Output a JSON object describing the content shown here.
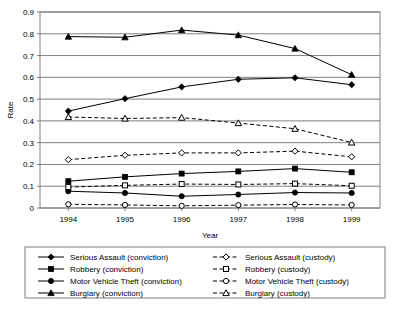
{
  "chart_data": {
    "type": "line",
    "title": "",
    "xlabel": "Year",
    "ylabel": "Rate",
    "categories": [
      "1994",
      "1995",
      "1996",
      "1997",
      "1998",
      "1999"
    ],
    "x": [
      1994,
      1995,
      1996,
      1997,
      1998,
      1999
    ],
    "ylim": [
      0,
      0.9
    ],
    "yticks": [
      0,
      0.1,
      0.2,
      0.3,
      0.4,
      0.5,
      0.6,
      0.7,
      0.8,
      0.9
    ],
    "ytick_labels": [
      "0",
      "0.1",
      "0.2",
      "0.3",
      "0.4",
      "0.5",
      "0.6",
      "0.7",
      "0.8",
      "0.9"
    ],
    "grid": "horizontal",
    "legend_position": "bottom",
    "series": [
      {
        "name": "Serious Assault (conviction)",
        "marker": "diamond",
        "fill": "solid",
        "line": "solid",
        "values": [
          0.445,
          0.502,
          0.556,
          0.591,
          0.598,
          0.566
        ]
      },
      {
        "name": "Robbery (conviction)",
        "marker": "square",
        "fill": "solid",
        "line": "solid",
        "values": [
          0.123,
          0.143,
          0.158,
          0.168,
          0.181,
          0.164
        ]
      },
      {
        "name": "Motor Vehicle Theft (conviction)",
        "marker": "circle",
        "fill": "solid",
        "line": "solid",
        "values": [
          0.077,
          0.069,
          0.054,
          0.062,
          0.071,
          0.069
        ]
      },
      {
        "name": "Burglary (conviction)",
        "marker": "triangle",
        "fill": "solid",
        "line": "solid",
        "values": [
          0.787,
          0.784,
          0.817,
          0.794,
          0.732,
          0.612
        ]
      },
      {
        "name": "Serious Assault (custody)",
        "marker": "diamond",
        "fill": "hollow",
        "line": "dashed",
        "values": [
          0.222,
          0.242,
          0.253,
          0.253,
          0.261,
          0.235
        ]
      },
      {
        "name": "Robbery (custody)",
        "marker": "square",
        "fill": "hollow",
        "line": "dashed",
        "values": [
          0.096,
          0.104,
          0.11,
          0.108,
          0.112,
          0.102
        ]
      },
      {
        "name": "Motor Vehicle Theft  (custody)",
        "marker": "circle",
        "fill": "hollow",
        "line": "dashed",
        "values": [
          0.017,
          0.014,
          0.01,
          0.013,
          0.016,
          0.014
        ]
      },
      {
        "name": "Burglary (custody)",
        "marker": "triangle",
        "fill": "hollow",
        "line": "dashed",
        "values": [
          0.418,
          0.411,
          0.415,
          0.39,
          0.364,
          0.301
        ]
      }
    ]
  },
  "colors": {
    "line": "#000000",
    "grid": "#808080",
    "axis": "#808080",
    "marker_fill": "#000000",
    "marker_hollow": "#ffffff",
    "background": "#ffffff",
    "legend_border": "#808080"
  },
  "legend": {
    "column_left": [
      "Serious Assault (conviction)",
      "Robbery (conviction)",
      "Motor Vehicle Theft (conviction)",
      "Burglary (conviction)"
    ],
    "column_right": [
      "Serious Assault (custody)",
      "Robbery (custody)",
      "Motor Vehicle Theft  (custody)",
      "Burglary (custody)"
    ]
  }
}
